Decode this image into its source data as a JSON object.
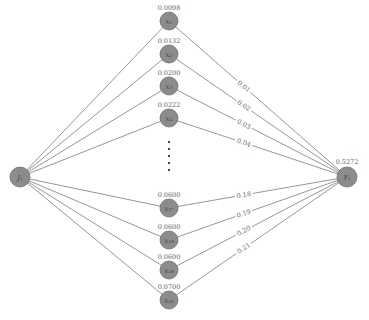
{
  "diagram": {
    "type": "bipartite-network",
    "source": {
      "id": "J1",
      "label": "J₁"
    },
    "target": {
      "id": "Y1",
      "label": "Y₁",
      "value": "0.5272"
    },
    "hidden_nodes": [
      {
        "label": "x₁",
        "value": "0.0098",
        "weight": "0.01"
      },
      {
        "label": "x₂",
        "value": "0.0132",
        "weight": "0.02"
      },
      {
        "label": "x₃",
        "value": "0.0200",
        "weight": "0.03"
      },
      {
        "label": "x₄",
        "value": "0.0222",
        "weight": "0.04"
      },
      {
        "label": "x₁₇",
        "value": "0.0600",
        "weight": "0.18"
      },
      {
        "label": "x₁₈",
        "value": "0.0600",
        "weight": "0.19"
      },
      {
        "label": "x₁₉",
        "value": "0.0600",
        "weight": "0.20"
      },
      {
        "label": "x₂₀",
        "value": "0.0700",
        "weight": "0.21"
      }
    ],
    "ellipsis": "⋮"
  }
}
